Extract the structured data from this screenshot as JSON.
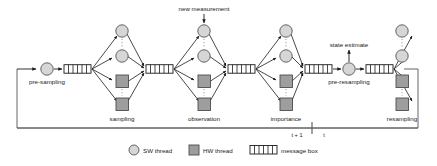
{
  "diagram": {
    "title_present": false,
    "annotations": {
      "new_measurement": "new measurement",
      "state_estimate": "state estimate"
    },
    "stage_labels": {
      "pre_sampling": "pre-sampling",
      "sampling": "sampling",
      "observation": "observation",
      "importance": "importance",
      "pre_resampling": "pre-resampling",
      "resampling": "resampling"
    },
    "time_axis": {
      "left_label": "t + 1",
      "right_label": "t"
    },
    "legend": [
      {
        "id": "sw-thread",
        "shape": "circle",
        "label": "SW thread",
        "fill": "#d6d6d6",
        "stroke": "#555555"
      },
      {
        "id": "hw-thread",
        "shape": "square",
        "label": "HW thread",
        "fill": "#9e9e9e",
        "stroke": "#4d4d4d"
      },
      {
        "id": "message-box",
        "shape": "striped-box",
        "label": "message box",
        "fill": "#ffffff",
        "stroke": "#1a1a1a"
      }
    ],
    "colors": {
      "sw_thread_fill": "#d6d6d6",
      "sw_thread_stroke": "#555555",
      "hw_thread_fill": "#9e9e9e",
      "hw_thread_stroke": "#4d4d4d",
      "message_box_stroke": "#1a1a1a",
      "edge": "#1a1a1a",
      "frame": "#555555",
      "dots": "#888888"
    },
    "counts": {
      "clusters": 4,
      "sw_threads_per_cluster": 2,
      "hw_threads_per_cluster": 2,
      "message_boxes": 6
    }
  }
}
